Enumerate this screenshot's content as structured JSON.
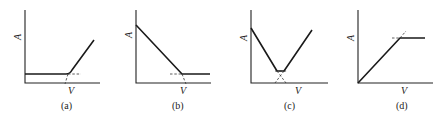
{
  "figure": {
    "panels": [
      {
        "id": "a",
        "caption": "(a)",
        "y_label": "A",
        "x_label": "V",
        "shape": "flat then rising (hinge)",
        "axes": {
          "x0": 25,
          "y0": 83,
          "x_end": 100,
          "y_top": 10
        },
        "curve": "M25,74 L66,74 Q70,74 72,70 L94,40",
        "dashes": [
          "M68,74 L81,74",
          "M68,74 L65,84"
        ],
        "ylabel_pos": [
          19,
          37
        ],
        "xlabel_pos": [
          70,
          93
        ],
        "caption_pos": [
          62,
          108
        ]
      },
      {
        "id": "b",
        "caption": "(b)",
        "y_label": "A",
        "x_label": "V",
        "shape": "falling then flat",
        "axes": {
          "x0": 136,
          "y0": 83,
          "x_end": 211,
          "y_top": 10
        },
        "curve": "M136,25 L182,74 L210,74",
        "dashes": [
          "M170,74 L182,74",
          "M182,74 L186,84"
        ],
        "ylabel_pos": [
          130,
          37
        ],
        "xlabel_pos": [
          181,
          93
        ],
        "caption_pos": [
          173,
          108
        ]
      },
      {
        "id": "c",
        "caption": "(c)",
        "y_label": "A",
        "x_label": "V",
        "shape": "V-shaped with flat bottom",
        "axes": {
          "x0": 251,
          "y0": 83,
          "x_end": 328,
          "y_top": 10
        },
        "curve": "M251,28 L277,71 L284,71 L312,30",
        "dashes": [
          "M277,71 L286,83",
          "M284,71 L275,83",
          "M275,71 L287,71"
        ],
        "ylabel_pos": [
          245,
          39
        ],
        "xlabel_pos": [
          296,
          93
        ],
        "caption_pos": [
          285,
          108
        ]
      },
      {
        "id": "d",
        "caption": "(d)",
        "y_label": "A",
        "x_label": "V",
        "shape": "rising then flat (saturation)",
        "axes": {
          "x0": 358,
          "y0": 83,
          "x_end": 433,
          "y_top": 10
        },
        "curve": "M358,83 L400,38 L425,38",
        "dashes": [
          "M392,38 L400,38",
          "M400,38 L406,31"
        ],
        "ylabel_pos": [
          352,
          39
        ],
        "xlabel_pos": [
          402,
          93
        ],
        "caption_pos": [
          397,
          108
        ]
      }
    ]
  }
}
